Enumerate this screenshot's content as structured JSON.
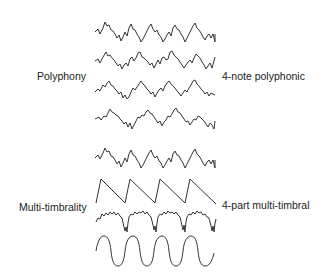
{
  "diagram": {
    "groups": [
      {
        "left_label": "Polyphony",
        "right_label": "4-note polyphonic",
        "waveforms": [
          "complex-1",
          "complex-2",
          "complex-3",
          "complex-4"
        ]
      },
      {
        "left_label": "Multi-timbrality",
        "right_label": "4-part multi-timbral",
        "waveforms": [
          "complex",
          "sawtooth",
          "noisy-pulse",
          "sine"
        ]
      }
    ],
    "cycles_per_wave": 4
  }
}
